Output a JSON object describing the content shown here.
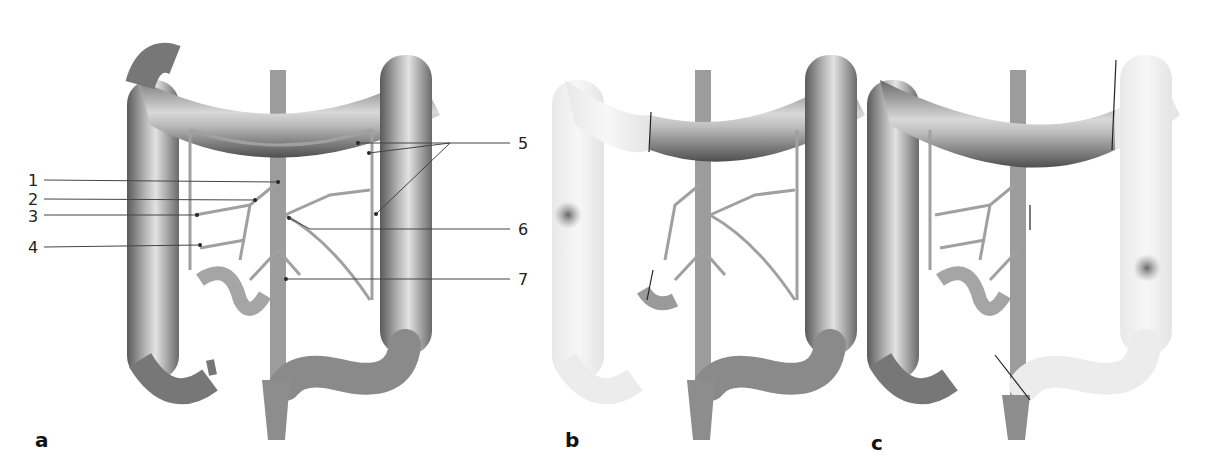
{
  "figure": {
    "panels": [
      {
        "id": "a",
        "label": "a",
        "description": "Colon with mesenteric arterial supply, numbered vessels"
      },
      {
        "id": "b",
        "label": "b",
        "description": "Right colon resected (faded), tumor in ascending colon"
      },
      {
        "id": "c",
        "label": "c",
        "description": "Left colon resected (faded), tumor in descending colon"
      }
    ],
    "callouts_left": [
      {
        "number": "1"
      },
      {
        "number": "2"
      },
      {
        "number": "3"
      },
      {
        "number": "4"
      }
    ],
    "callouts_right": [
      {
        "number": "5"
      },
      {
        "number": "6"
      },
      {
        "number": "7"
      }
    ],
    "signature": "dougr",
    "colors": {
      "colon_dark": "#6e6e6e",
      "colon_mid": "#a8a8a8",
      "colon_light": "#dcdcdc",
      "faded": "#eeeeee",
      "vessel": "#9a9a9a",
      "tumor": "#7a7a7a",
      "leader": "#444444"
    }
  }
}
